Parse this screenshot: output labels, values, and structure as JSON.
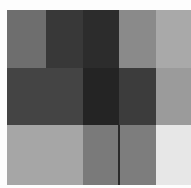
{
  "image": {
    "description": "Grid of grayscale rectangles (blocky grayscale mosaic)",
    "width": 191,
    "height": 188,
    "background": "#fdfdfd",
    "blocks": [
      {
        "x": 7,
        "y": 10,
        "w": 39,
        "h": 58,
        "color": "#6e6e6e"
      },
      {
        "x": 46,
        "y": 10,
        "w": 37,
        "h": 58,
        "color": "#383838"
      },
      {
        "x": 83,
        "y": 10,
        "w": 36,
        "h": 58,
        "color": "#2c2c2c"
      },
      {
        "x": 119,
        "y": 10,
        "w": 37,
        "h": 58,
        "color": "#8a8a8a"
      },
      {
        "x": 156,
        "y": 10,
        "w": 35,
        "h": 58,
        "color": "#a9a9a9"
      },
      {
        "x": 7,
        "y": 68,
        "w": 76,
        "h": 57,
        "color": "#444444"
      },
      {
        "x": 83,
        "y": 68,
        "w": 36,
        "h": 57,
        "color": "#242424"
      },
      {
        "x": 119,
        "y": 68,
        "w": 37,
        "h": 57,
        "color": "#3c3c3c"
      },
      {
        "x": 156,
        "y": 68,
        "w": 35,
        "h": 57,
        "color": "#9b9b9b"
      },
      {
        "x": 7,
        "y": 125,
        "w": 76,
        "h": 60,
        "color": "#a6a6a6"
      },
      {
        "x": 83,
        "y": 125,
        "w": 36,
        "h": 60,
        "color": "#7a7a7a"
      },
      {
        "x": 119,
        "y": 125,
        "w": 37,
        "h": 60,
        "color": "#7d7d7d"
      },
      {
        "x": 156,
        "y": 125,
        "w": 35,
        "h": 60,
        "color": "#e7e7e7"
      }
    ],
    "lines": [
      {
        "x": 118,
        "y": 125,
        "w": 2,
        "h": 60,
        "color": "#2a2a2a"
      }
    ]
  }
}
